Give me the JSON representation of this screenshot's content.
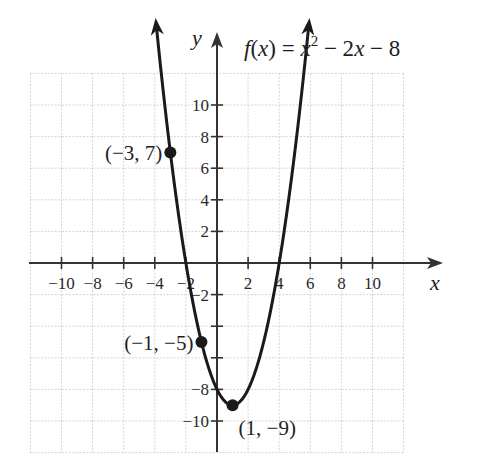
{
  "chart_data": {
    "type": "line",
    "title_parts": {
      "f": "f",
      "open": "(",
      "x": "x",
      "close_eq": ") = ",
      "x2": "x",
      "sup": "2",
      "rest": " − 2",
      "x3": "x",
      "tail": " − 8"
    },
    "function": "x^2 - 2x - 8",
    "xlabel": "x",
    "ylabel": "y",
    "xlim": [
      -12,
      12
    ],
    "ylim": [
      -12,
      12
    ],
    "grid": true,
    "grid_step": 2,
    "x_ticks": [
      -10,
      -8,
      -6,
      -4,
      -2,
      2,
      4,
      6,
      8,
      10
    ],
    "x_tick_labels": [
      "−10",
      "−8",
      "−6",
      "−4",
      "−2",
      "2",
      "4",
      "6",
      "8",
      "10"
    ],
    "y_ticks": [
      10,
      8,
      6,
      4,
      2,
      -2,
      -4,
      -6,
      -8,
      -10
    ],
    "y_tick_labels": [
      "10",
      "8",
      "6",
      "4",
      "2",
      "−2",
      "",
      "",
      "−8",
      "−10"
    ],
    "curve_domain": [
      -3.9,
      5.9
    ],
    "points": [
      {
        "x": -3,
        "y": 7,
        "label": "(−3, 7)"
      },
      {
        "x": -1,
        "y": -5,
        "label": "(−1, −5)"
      },
      {
        "x": 1,
        "y": -9,
        "label": "(1, −9)"
      }
    ],
    "colors": {
      "curve": "#1a1a1a",
      "axis": "#333333",
      "grid": "#d4d4d4",
      "text": "#1e1e1e"
    }
  }
}
